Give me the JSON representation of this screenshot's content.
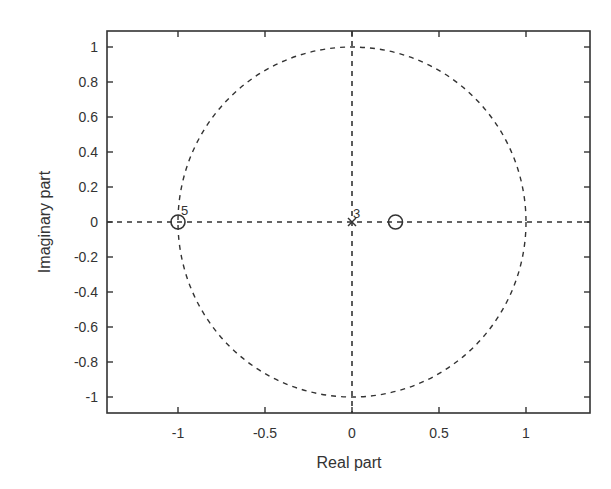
{
  "chart_data": {
    "type": "scatter",
    "subtype": "pole-zero plot",
    "title": "",
    "xlabel": "Real part",
    "ylabel": "Imaginary part",
    "xlim": [
      -1.3,
      1.4
    ],
    "ylim": [
      -1.1,
      1.1
    ],
    "x_ticks": [
      -1,
      -0.5,
      0,
      0.5,
      1
    ],
    "x_tick_labels": [
      "-1",
      "-0.5",
      "0",
      "0.5",
      "1"
    ],
    "y_ticks": [
      1,
      0.8,
      0.6,
      0.4,
      0.2,
      0,
      -0.2,
      -0.4,
      -0.6,
      -0.8,
      -1
    ],
    "y_tick_labels": [
      "1",
      "0.8",
      "0.6",
      "0.4",
      "0.2",
      "0",
      "-0.2",
      "-0.4",
      "-0.6",
      "-0.8",
      "-1"
    ],
    "grid": false,
    "legend": null,
    "unit_circle": {
      "center": [
        0,
        0
      ],
      "radius": 1,
      "style": "dashed"
    },
    "reference_axes": {
      "real_axis": "dashed",
      "imag_axis": "dashed"
    },
    "zeros": [
      {
        "real": -1,
        "imag": 0,
        "multiplicity": 5,
        "label": "5"
      },
      {
        "real": 0.25,
        "imag": 0,
        "multiplicity": 1,
        "label": ""
      }
    ],
    "poles": [
      {
        "real": 0,
        "imag": 0,
        "multiplicity": 3,
        "label": "3"
      }
    ]
  }
}
